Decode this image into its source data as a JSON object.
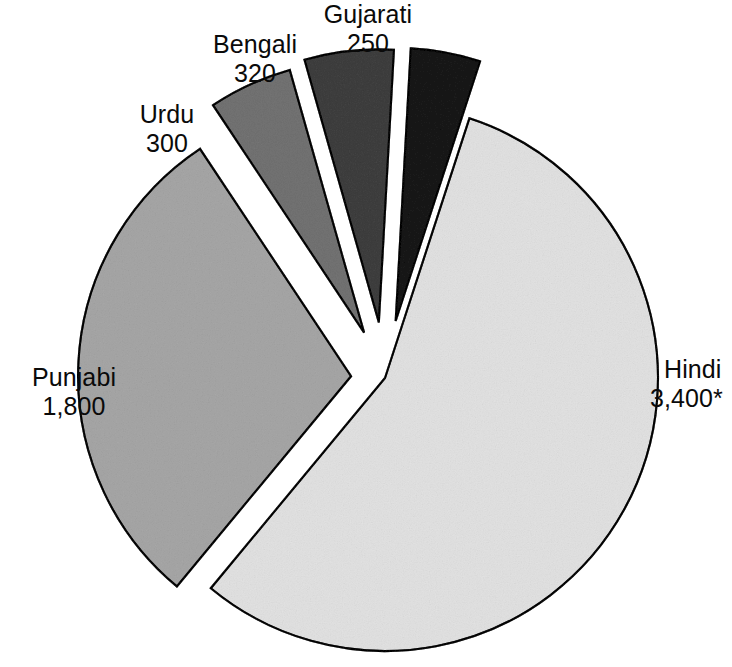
{
  "chart_data": {
    "type": "pie",
    "title": "",
    "subtitle": "",
    "xlabel": "",
    "ylabel": "",
    "legend_position": "none",
    "grid": false,
    "value_suffix_note": "* asterisk appears on the Hindi value",
    "total": 6070,
    "categories": [
      "Hindi",
      "Punjabi",
      "Urdu",
      "Bengali",
      "Gujarati"
    ],
    "values": [
      3400,
      1800,
      300,
      320,
      250
    ],
    "value_labels": [
      "3,400*",
      "1,800",
      "300",
      "320",
      "250"
    ],
    "colors": [
      "#f0f0f0",
      "#cdcdcd",
      "#a9a9a9",
      "#7c7c7c",
      "#4c4c4c"
    ],
    "exploded": [
      false,
      true,
      true,
      true,
      true
    ],
    "slices": [
      {
        "name": "Hindi",
        "value": 3400,
        "value_label": "3,400*",
        "color": "#f0f0f0",
        "percent": 56.0,
        "exploded": false,
        "label_name": "Hindi",
        "label_value": "3,400*"
      },
      {
        "name": "Punjabi",
        "value": 1800,
        "value_label": "1,800",
        "color": "#cdcdcd",
        "percent": 29.7,
        "exploded": true,
        "label_name": "Punjabi",
        "label_value": "1,800"
      },
      {
        "name": "Urdu",
        "value": 300,
        "value_label": "300",
        "color": "#a9a9a9",
        "percent": 4.9,
        "exploded": true,
        "label_name": "Urdu",
        "label_value": "300"
      },
      {
        "name": "Bengali",
        "value": 320,
        "value_label": "320",
        "color": "#7c7c7c",
        "percent": 5.3,
        "exploded": true,
        "label_name": "Bengali",
        "label_value": "320"
      },
      {
        "name": "Gujarati",
        "value": 250,
        "value_label": "250",
        "color": "#4c4c4c",
        "percent": 4.1,
        "exploded": true,
        "label_name": "Gujarati",
        "label_value": "250"
      }
    ],
    "geometry": {
      "cx": 385,
      "cy": 378,
      "radius": 273,
      "start_angle_deg": -72,
      "direction": "clockwise",
      "explode_offsets": [
        0,
        34,
        50,
        56,
        58
      ],
      "stroke_color": "#2b2b2b"
    }
  }
}
